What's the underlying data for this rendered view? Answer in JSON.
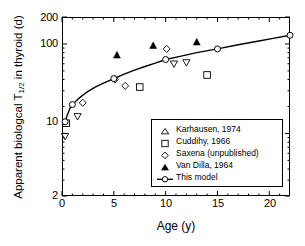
{
  "chart_data": {
    "type": "scatter",
    "title": "",
    "xlabel": "Age (y)",
    "ylabel_parts": {
      "pre": "Apparent biologcal T",
      "sub": "1/2",
      "post": " in thyroid (d)"
    },
    "ylabel": "Apparent biologcal T1/2 in thyroid (d)",
    "xlim": [
      0,
      22
    ],
    "ylim": [
      2,
      200
    ],
    "yscale": "log",
    "xscale": "linear",
    "xticks": [
      "0",
      "5",
      "10",
      "15",
      "20"
    ],
    "xtick_values": [
      0,
      5,
      10,
      15,
      20
    ],
    "yticks": [
      "2",
      "10",
      "100",
      "200"
    ],
    "ytick_values": [
      2,
      10,
      100,
      200
    ],
    "grid": false,
    "legend_position": "lower right",
    "series": [
      {
        "name": "Karhausen, 1974",
        "marker": "open-down-triangle",
        "color": "#000000",
        "points": [
          [
            0.3,
            9.3
          ],
          [
            1.5,
            15.5
          ],
          [
            12.0,
            62.0
          ],
          [
            10.8,
            60.0
          ]
        ]
      },
      {
        "name": "Cuddihy, 1966",
        "marker": "open-square",
        "color": "#000000",
        "points": [
          [
            0.4,
            13.0
          ],
          [
            7.5,
            33.0
          ],
          [
            14.0,
            45.0
          ]
        ]
      },
      {
        "name": "Saxena (unpublished)",
        "marker": "open-diamond",
        "color": "#000000",
        "points": [
          [
            2.0,
            22.0
          ],
          [
            5.1,
            40.0
          ],
          [
            6.1,
            34.0
          ],
          [
            10.1,
            88.0
          ]
        ]
      },
      {
        "name": "Van Dilla, 1964",
        "marker": "filled-triangle",
        "color": "#000000",
        "points": [
          [
            5.3,
            75.0
          ],
          [
            8.8,
            96.0
          ],
          [
            13.0,
            105.0
          ]
        ]
      },
      {
        "name": "This model",
        "marker": "line-open-circle",
        "color": "#000000",
        "points": [
          [
            0.3,
            13.5
          ],
          [
            1.0,
            21.0
          ],
          [
            5.0,
            41.0
          ],
          [
            10.0,
            67.0
          ],
          [
            15.0,
            88.0
          ],
          [
            22.0,
            125.0
          ]
        ]
      }
    ],
    "model_curve": [
      [
        0.25,
        12.8
      ],
      [
        0.5,
        16.0
      ],
      [
        0.8,
        19.5
      ],
      [
        1.0,
        21.0
      ],
      [
        1.6,
        24.5
      ],
      [
        2.4,
        29.0
      ],
      [
        3.2,
        33.0
      ],
      [
        4.0,
        36.5
      ],
      [
        5.0,
        41.0
      ],
      [
        6.0,
        46.0
      ],
      [
        7.0,
        51.0
      ],
      [
        8.0,
        56.0
      ],
      [
        9.0,
        61.0
      ],
      [
        10.0,
        67.0
      ],
      [
        11.5,
        73.0
      ],
      [
        13.0,
        80.0
      ],
      [
        15.0,
        88.0
      ],
      [
        17.0,
        98.0
      ],
      [
        19.0,
        108.0
      ],
      [
        20.5,
        116.0
      ],
      [
        22.0,
        125.0
      ]
    ]
  },
  "legend": {
    "items": [
      {
        "label": "Karhausen, 1974",
        "symbol": "open-down-triangle"
      },
      {
        "label": "Cuddihy, 1966",
        "symbol": "open-square"
      },
      {
        "label": "Saxena (unpublished)",
        "symbol": "open-diamond"
      },
      {
        "label": "Van Dilla, 1964",
        "symbol": "filled-triangle"
      },
      {
        "label": "This model",
        "symbol": "line-open-circle"
      }
    ]
  }
}
